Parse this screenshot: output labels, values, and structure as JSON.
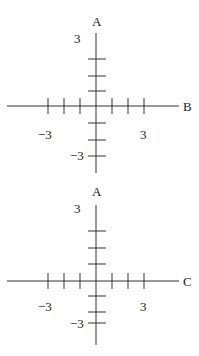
{
  "diagrams": [
    {
      "vertical_axis_label": "A",
      "horizontal_axis_label": "B",
      "top_tick_label": "3",
      "bottom_tick_label": "−3",
      "left_tick_label": "−3",
      "right_tick_label": "3"
    },
    {
      "vertical_axis_label": "A",
      "horizontal_axis_label": "C",
      "top_tick_label": "3",
      "bottom_tick_label": "−3",
      "left_tick_label": "−3",
      "right_tick_label": "3"
    }
  ],
  "colors": {
    "line": "#333333",
    "text": "#1a1a1a"
  }
}
